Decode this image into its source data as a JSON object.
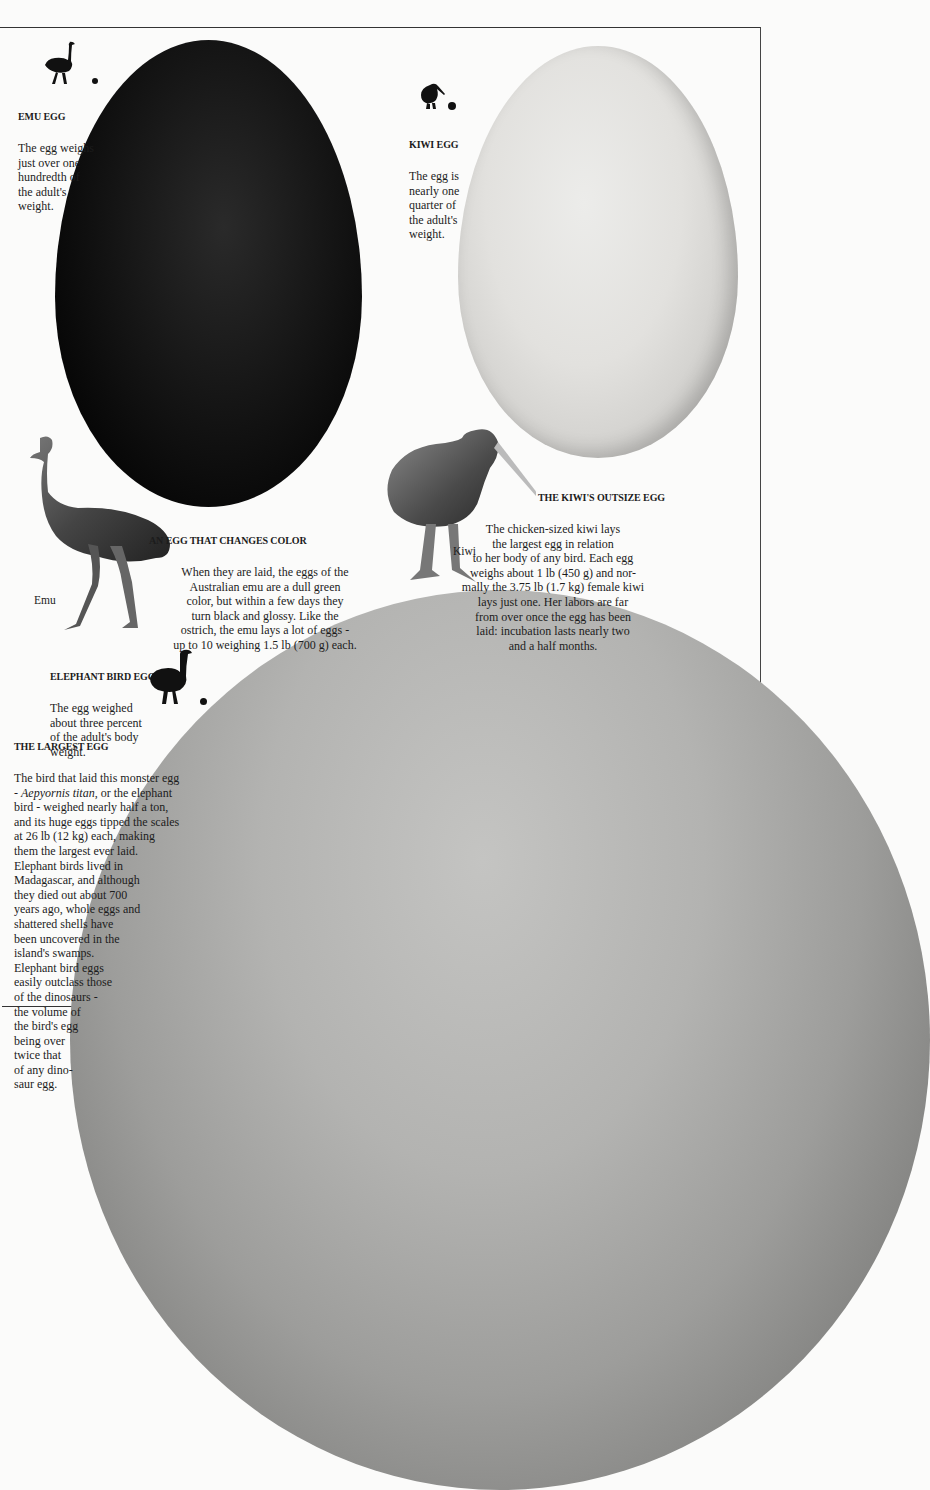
{
  "page": {
    "background": "#fbfbfa",
    "rule_color": "#333333"
  },
  "emu_egg": {
    "heading": "Emu egg",
    "text": "The egg weighs\njust over one\nhundredth of\nthe adult's\nweight.",
    "icon": "emu-silhouette-icon",
    "egg_color": "#0a0a0a"
  },
  "kiwi_egg": {
    "heading": "Kiwi egg",
    "text": "The egg is\nnearly one\nquarter of\nthe adult's\nweight.",
    "icon": "kiwi-silhouette-icon",
    "egg_color": "#dcdbd8"
  },
  "color_change": {
    "heading": "An egg that changes color",
    "text": "When they are laid, the eggs of the\nAustralian emu are a dull green\ncolor, but within a few days they\nturn black and glossy. Like the\nostrich, the emu lays a lot of eggs -\nup to 10 weighing 1.5 lb (700 g) each."
  },
  "kiwi_outsize": {
    "heading": "The kiwi's outsize egg",
    "text": "The chicken-sized kiwi lays\nthe largest egg in relation\nto her body of any bird. Each egg\nweighs about 1 lb (450 g) and nor-\nmally the 3.75 lb (1.7 kg) female kiwi\nlays just one. Her labors are far\nfrom over once the egg has been\nlaid: incubation lasts nearly two\nand a half months."
  },
  "elephant_bird_egg": {
    "heading": "Elephant bird egg",
    "text": "The egg weighed\nabout three percent\nof the adult's body\nweight.",
    "icon": "elephant-bird-silhouette-icon",
    "egg_color": "#a8a8a6"
  },
  "largest_egg": {
    "heading": "The largest egg",
    "text_before_species": "The bird that laid this monster egg\n- ",
    "species": "Aepyornis titan",
    "text_after_species": ", or the elephant\nbird - weighed nearly half a ton,\nand its huge eggs tipped the scales\nat 26 lb (12 kg) each, making\nthem the largest ever laid.\nElephant birds lived in\nMadagascar, and although\nthey died out about 700\nyears ago, whole eggs and\nshattered shells have\nbeen uncovered in the\nisland's swamps.\nElephant bird eggs\neasily outclass those\nof the dinosaurs -\nthe volume of\nthe bird's egg\nbeing over\ntwice that\nof any dino-\nsaur egg."
  },
  "labels": {
    "emu": "Emu",
    "kiwi": "Kiwi"
  }
}
